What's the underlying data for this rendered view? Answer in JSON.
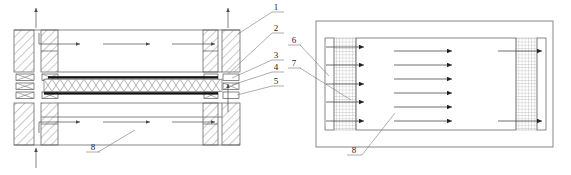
{
  "figure": {
    "type": "patent-technical-drawing",
    "background_color": "#ffffff",
    "line_color": "#555555",
    "dark_plate_color": "#111111",
    "panel_count": 2
  },
  "left_view": {
    "name": "cross-section-view",
    "callouts": [
      {
        "id": "1",
        "label": "1",
        "x": 276,
        "y": 14
      },
      {
        "id": "2",
        "label": "2",
        "x": 276,
        "y": 35
      },
      {
        "id": "3",
        "label": "3",
        "x": 276,
        "y": 62
      },
      {
        "id": "4",
        "label": "4",
        "x": 276,
        "y": 74
      },
      {
        "id": "5",
        "label": "5",
        "x": 276,
        "y": 88
      },
      {
        "id": "8",
        "label": "8",
        "x": 94,
        "y": 155
      }
    ],
    "flow_arrows": {
      "upper_horizontal": 3,
      "lower_horizontal": 3,
      "vertical_inlet": 2,
      "vertical_outlet": 2
    },
    "core": {
      "pattern": "x-lattice",
      "cell_count": 22,
      "top_plate": "dark",
      "bottom_plate": "dark"
    }
  },
  "right_view": {
    "name": "plan-view",
    "callouts": [
      {
        "id": "6",
        "label": "6",
        "x": 294,
        "y": 47
      },
      {
        "id": "7",
        "label": "7",
        "x": 294,
        "y": 70
      },
      {
        "id": "8",
        "label": "8",
        "x": 355,
        "y": 157
      }
    ],
    "flow_arrows": {
      "left_inlet_rows": 5,
      "center_rows": 6,
      "right_outlet_rows": 2
    },
    "header_pattern": "fine-grid-hatch"
  }
}
